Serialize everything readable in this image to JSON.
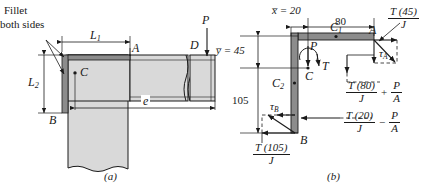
{
  "figure": {
    "panels": [
      {
        "caption": "(a)",
        "labels": {
          "fillet_line1": "Fillet",
          "fillet_line2": "both sides",
          "L1": "L",
          "L1_sub": "1",
          "L2": "L",
          "L2_sub": "2",
          "point_A": "A",
          "point_B": "B",
          "point_C": "C",
          "point_D": "D",
          "force_P": "P",
          "dim_e": "e"
        }
      },
      {
        "caption": "(b)",
        "labels": {
          "xbar": "x̅ = 20",
          "ybar": "y̅ = 45",
          "dim_80": "80",
          "dim_105": "105",
          "C1": "C",
          "C1_sub": "1",
          "C2": "C",
          "C2_sub": "2",
          "point_A": "A",
          "point_B": "B",
          "point_C": "C",
          "force_P": "P",
          "torque_T": "T",
          "tau_A": "τ",
          "tau_A_sub": "A",
          "tau_B": "τ",
          "tau_B_sub": "B"
        },
        "formulas": {
          "tA_top": {
            "num": "T (45)",
            "den": "J"
          },
          "tA_left": {
            "num": "T (80)",
            "den": "J",
            "op": "+",
            "term_num": "P",
            "term_den": "A"
          },
          "tB_right": {
            "num": "T (20)",
            "den": "J",
            "op": "−",
            "term_num": "P",
            "term_den": "A"
          },
          "tB_bottom": {
            "num": "T (105)",
            "den": "J"
          }
        }
      }
    ],
    "colors": {
      "body_fill": "#d9d9d9",
      "weld_fill": "#8c8c8c",
      "outline": "#1a1a1a",
      "background": "#ffffff"
    }
  }
}
